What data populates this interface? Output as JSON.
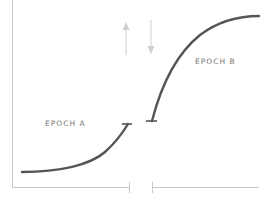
{
  "diagram": {
    "labels": {
      "epoch_a": "EPOCH A",
      "epoch_b": "EPOCH B"
    },
    "colors": {
      "curve": "#555555",
      "axis": "#c8c8c8",
      "arrow": "#cfcfcf",
      "label": "#777777"
    },
    "arrows": [
      {
        "name": "up-arrow",
        "direction": "up"
      },
      {
        "name": "down-arrow",
        "direction": "down"
      }
    ]
  }
}
